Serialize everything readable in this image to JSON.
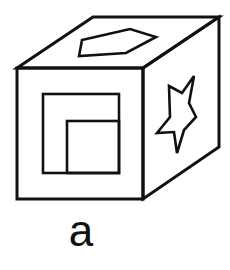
{
  "figure": {
    "caption": "a",
    "colors": {
      "stroke": "#111111",
      "background": "#ffffff"
    },
    "cube": {
      "front_face": {
        "x": 17,
        "y": 68,
        "width": 126,
        "height": 131
      },
      "top_face_points": "17,68 93,17 219,17 143,68",
      "right_face_points": "143,68 219,17 219,147 143,199"
    },
    "front_face_shapes": {
      "outer_square": {
        "x": 43,
        "y": 94,
        "width": 76,
        "height": 79
      },
      "inner_square": {
        "x": 67,
        "y": 121,
        "width": 52,
        "height": 52
      }
    },
    "top_face_shape": {
      "name": "pentagon",
      "points": "82,40 130,29 156,37 126,53 79,56"
    },
    "right_face_shape": {
      "name": "star",
      "points": "169,86 182,93 194,76 189,103 196,117 184,130 177,153 174,132 157,133 170,117"
    }
  }
}
